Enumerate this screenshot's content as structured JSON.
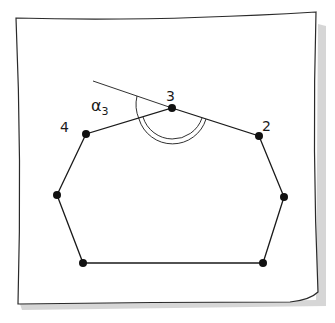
{
  "diagram": {
    "type": "polygon-exterior-angle-sketch",
    "labels": {
      "vertex_3": "3",
      "vertex_2": "2",
      "vertex_4": "4",
      "angle": "α",
      "angle_subscript": "3"
    },
    "vertices": [
      {
        "id": "3",
        "x": 172,
        "y": 108
      },
      {
        "id": "2",
        "x": 259,
        "y": 136
      },
      {
        "id": "r",
        "x": 284,
        "y": 197
      },
      {
        "id": "br",
        "x": 263,
        "y": 263
      },
      {
        "id": "bl",
        "x": 83,
        "y": 263
      },
      {
        "id": "l",
        "x": 57,
        "y": 195
      },
      {
        "id": "4",
        "x": 86,
        "y": 134
      }
    ],
    "colors": {
      "ink": "#1a1a1a",
      "paper": "#ffffff",
      "shadow": "#bdbdbd"
    }
  }
}
